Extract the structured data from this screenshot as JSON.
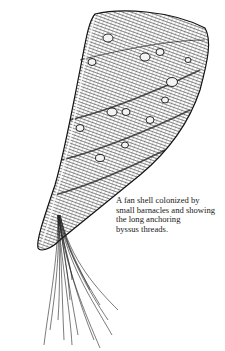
{
  "figure": {
    "caption_lines": [
      "A fan shell colonized by",
      "small barnacles and showing",
      "the long anchoring",
      "byssus threads."
    ]
  },
  "colors": {
    "ink": "#1a1a1a",
    "background": "#ffffff"
  }
}
